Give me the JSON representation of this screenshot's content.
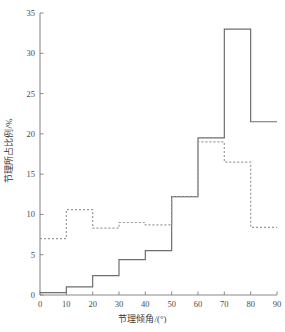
{
  "chart_data": {
    "type": "line",
    "title": "",
    "subtitle": "",
    "xlabel": "节理倾角/(°)",
    "ylabel": "节理所占比例/%",
    "xlim": [
      0,
      90
    ],
    "ylim": [
      0,
      35
    ],
    "xticks": [
      0,
      10,
      20,
      30,
      40,
      50,
      60,
      70,
      80,
      90
    ],
    "yticks": [
      0,
      5,
      10,
      15,
      20,
      25,
      30,
      35
    ],
    "xtick_labels": [
      "0",
      "10",
      "20",
      "30",
      "40",
      "50",
      "60",
      "70",
      "80",
      "90"
    ],
    "ytick_labels": [
      "0",
      "5",
      "10",
      "15",
      "20",
      "25",
      "30",
      "35"
    ],
    "grid": false,
    "legend": "none",
    "bin_edges": [
      0,
      10,
      20,
      30,
      40,
      50,
      60,
      70,
      80,
      90
    ],
    "categories": [
      "0-10",
      "10-20",
      "20-30",
      "30-40",
      "40-50",
      "50-60",
      "60-70",
      "70-80",
      "80-90"
    ],
    "series": [
      {
        "name": "solid-step",
        "style": "solid",
        "color": "#6e6e6e",
        "values": [
          0.3,
          1.0,
          2.4,
          4.4,
          5.5,
          12.2,
          19.5,
          33.0,
          21.5
        ]
      },
      {
        "name": "dotted-step",
        "style": "dotted",
        "color": "#9a9a9a",
        "values": [
          7.0,
          10.6,
          8.3,
          9.0,
          8.7,
          12.2,
          19.0,
          16.5,
          8.4
        ]
      }
    ],
    "annotations": []
  }
}
